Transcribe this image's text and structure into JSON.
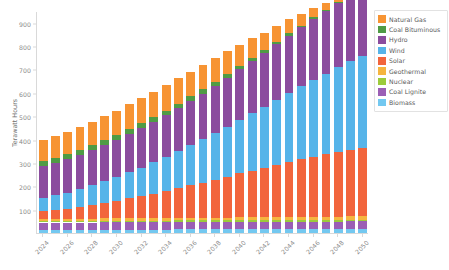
{
  "chart_data": {
    "type": "bar",
    "stacked": true,
    "title": "",
    "xlabel": "",
    "ylabel": "Terawatt Hours",
    "ylim": [
      0,
      950
    ],
    "ytick_step": 100,
    "yticks": [
      100,
      200,
      300,
      400,
      500,
      600,
      700,
      800,
      900
    ],
    "grid": false,
    "legend_position": "right",
    "x_label_interval": 2,
    "categories": [
      "2024",
      "2025",
      "2026",
      "2027",
      "2028",
      "2029",
      "2030",
      "2031",
      "2032",
      "2033",
      "2034",
      "2035",
      "2036",
      "2037",
      "2038",
      "2039",
      "2040",
      "2041",
      "2042",
      "2043",
      "2044",
      "2045",
      "2046",
      "2047",
      "2048",
      "2049",
      "2050"
    ],
    "x_tick_labels": [
      "2024",
      "2026",
      "2028",
      "2030",
      "2032",
      "2034",
      "2036",
      "2038",
      "2040",
      "2042",
      "2044",
      "2046",
      "2048",
      "2050"
    ],
    "stack_order_bottom_to_top": [
      "Biomass",
      "Coal Lignite",
      "Nuclear",
      "Geothermal",
      "Solar",
      "Wind",
      "Hydro",
      "Coal Bituminous",
      "Natural Gas"
    ],
    "series": [
      {
        "name": "Natural Gas",
        "color": "#F79433",
        "values": [
          92,
          94,
          96,
          98,
          100,
          102,
          104,
          106,
          107,
          108,
          108,
          108,
          106,
          104,
          100,
          96,
          90,
          84,
          76,
          68,
          60,
          50,
          40,
          30,
          22,
          14,
          6
        ]
      },
      {
        "name": "Coal Bituminous",
        "color": "#4F9B45",
        "values": [
          22,
          22,
          22,
          22,
          22,
          22,
          22,
          22,
          22,
          21,
          21,
          20,
          20,
          19,
          18,
          17,
          16,
          14,
          12,
          10,
          9,
          7,
          6,
          4,
          3,
          2,
          1
        ]
      },
      {
        "name": "Hydro",
        "color": "#8B4C9E",
        "values": [
          135,
          138,
          142,
          146,
          150,
          154,
          158,
          163,
          168,
          173,
          178,
          184,
          190,
          196,
          202,
          209,
          216,
          223,
          230,
          238,
          246,
          254,
          262,
          270,
          278,
          286,
          294
        ]
      },
      {
        "name": "Wind",
        "color": "#56B4E9",
        "values": [
          58,
          63,
          69,
          76,
          84,
          92,
          101,
          111,
          122,
          133,
          145,
          158,
          171,
          185,
          199,
          214,
          229,
          245,
          261,
          277,
          294,
          311,
          328,
          345,
          362,
          378,
          394
        ]
      },
      {
        "name": "Solar",
        "color": "#F2653C",
        "values": [
          32,
          37,
          43,
          50,
          58,
          66,
          75,
          85,
          95,
          105,
          116,
          127,
          139,
          151,
          163,
          175,
          188,
          200,
          212,
          224,
          236,
          247,
          258,
          268,
          277,
          285,
          292
        ]
      },
      {
        "name": "Geothermal",
        "color": "#F5B53F",
        "values": [
          9,
          9,
          9,
          9,
          10,
          10,
          10,
          10,
          10,
          11,
          11,
          11,
          11,
          11,
          12,
          12,
          12,
          12,
          12,
          13,
          13,
          13,
          13,
          13,
          14,
          14,
          14
        ]
      },
      {
        "name": "Nuclear",
        "color": "#9CCB3B",
        "values": [
          7,
          7,
          7,
          7,
          7,
          7,
          7,
          7,
          7,
          7,
          7,
          7,
          7,
          7,
          7,
          7,
          7,
          7,
          7,
          7,
          7,
          7,
          7,
          7,
          7,
          7,
          7
        ]
      },
      {
        "name": "Coal Lignite",
        "color": "#9B5FB5",
        "values": [
          31,
          31,
          31,
          31,
          31,
          31,
          31,
          31,
          31,
          31,
          31,
          31,
          31,
          31,
          31,
          31,
          31,
          31,
          31,
          31,
          31,
          31,
          31,
          31,
          31,
          31,
          31
        ]
      },
      {
        "name": "Biomass",
        "color": "#73C8F0",
        "values": [
          14,
          14,
          14,
          14,
          14,
          15,
          15,
          15,
          15,
          15,
          15,
          16,
          16,
          16,
          16,
          16,
          17,
          17,
          17,
          17,
          18,
          18,
          18,
          18,
          18,
          19,
          19
        ]
      }
    ]
  },
  "legend": {
    "items": [
      {
        "label": "Natural Gas",
        "color": "#F79433"
      },
      {
        "label": "Coal Bituminous",
        "color": "#4F9B45"
      },
      {
        "label": "Hydro",
        "color": "#8B4C9E"
      },
      {
        "label": "Wind",
        "color": "#56B4E9"
      },
      {
        "label": "Solar",
        "color": "#F2653C"
      },
      {
        "label": "Geothermal",
        "color": "#F5B53F"
      },
      {
        "label": "Nuclear",
        "color": "#9CCB3B"
      },
      {
        "label": "Coal Lignite",
        "color": "#9B5FB5"
      },
      {
        "label": "Biomass",
        "color": "#73C8F0"
      }
    ]
  }
}
